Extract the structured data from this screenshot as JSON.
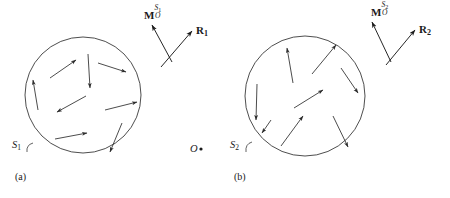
{
  "figure": {
    "width": 450,
    "height": 198,
    "background": "#ffffff",
    "stroke_color": "#3a3a3a",
    "text_color": "#1a1a1a"
  },
  "panels": [
    {
      "id": "panel-a",
      "caption": "(a)",
      "caption_pos": {
        "x": 15,
        "y": 178
      },
      "circle": {
        "cx": 83,
        "cy": 95,
        "r": 58
      },
      "surface_label": {
        "text": "S",
        "subscript": "1",
        "pos": {
          "x": 12,
          "y": 148
        },
        "leader": {
          "x1": 33,
          "y1": 146,
          "x2": 27,
          "y2": 152
        }
      },
      "moment_vector": {
        "name": "M",
        "subscript": "O",
        "superscript": "S",
        "superscript_sub": "1",
        "label_pos": {
          "x": 144,
          "y": 8
        },
        "arrow": {
          "x1": 172,
          "y1": 62,
          "x2": 152,
          "y2": 25
        }
      },
      "position_vector": {
        "name": "R",
        "subscript": "1",
        "label_pos": {
          "x": 196,
          "y": 25
        },
        "arrow": {
          "x1": 161,
          "y1": 67,
          "x2": 192,
          "y2": 31
        }
      },
      "arrows": [
        {
          "x1": 50,
          "y1": 78,
          "x2": 76,
          "y2": 60
        },
        {
          "x1": 88,
          "y1": 54,
          "x2": 90,
          "y2": 88
        },
        {
          "x1": 98,
          "y1": 63,
          "x2": 126,
          "y2": 72
        },
        {
          "x1": 38,
          "y1": 110,
          "x2": 33,
          "y2": 80
        },
        {
          "x1": 86,
          "y1": 96,
          "x2": 57,
          "y2": 112
        },
        {
          "x1": 105,
          "y1": 110,
          "x2": 137,
          "y2": 102
        },
        {
          "x1": 55,
          "y1": 139,
          "x2": 87,
          "y2": 133
        },
        {
          "x1": 122,
          "y1": 123,
          "x2": 110,
          "y2": 152
        }
      ]
    },
    {
      "id": "panel-b",
      "caption": "(b)",
      "caption_pos": {
        "x": 234,
        "y": 178
      },
      "circle": {
        "cx": 305,
        "cy": 96,
        "r": 60
      },
      "surface_label": {
        "text": "S",
        "subscript": "2",
        "pos": {
          "x": 230,
          "y": 148
        },
        "leader": {
          "x1": 252,
          "y1": 145,
          "x2": 246,
          "y2": 152
        }
      },
      "moment_vector": {
        "name": "M",
        "subscript": "O",
        "superscript": "S",
        "superscript_sub": "2",
        "label_pos": {
          "x": 371,
          "y": 8
        },
        "arrow": {
          "x1": 391,
          "y1": 62,
          "x2": 372,
          "y2": 22
        }
      },
      "position_vector": {
        "name": "R",
        "subscript": "2",
        "label_pos": {
          "x": 419,
          "y": 24
        },
        "arrow": {
          "x1": 386,
          "y1": 65,
          "x2": 415,
          "y2": 30
        }
      },
      "arrows": [
        {
          "x1": 293,
          "y1": 83,
          "x2": 287,
          "y2": 48
        },
        {
          "x1": 312,
          "y1": 74,
          "x2": 336,
          "y2": 45
        },
        {
          "x1": 257,
          "y1": 84,
          "x2": 256,
          "y2": 120
        },
        {
          "x1": 341,
          "y1": 68,
          "x2": 358,
          "y2": 93
        },
        {
          "x1": 294,
          "y1": 108,
          "x2": 323,
          "y2": 90
        },
        {
          "x1": 281,
          "y1": 146,
          "x2": 303,
          "y2": 116
        },
        {
          "x1": 333,
          "y1": 116,
          "x2": 348,
          "y2": 147
        },
        {
          "x1": 271,
          "y1": 120,
          "x2": 262,
          "y2": 133
        }
      ]
    }
  ],
  "origin": {
    "label": "O",
    "label_pos": {
      "x": 190,
      "y": 152
    },
    "dot": {
      "cx": 201,
      "cy": 149,
      "r": 1.6
    }
  }
}
